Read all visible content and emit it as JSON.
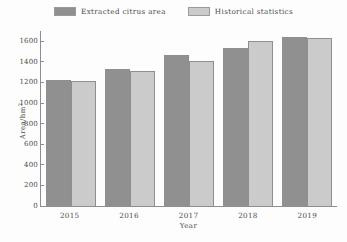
{
  "chart_data": {
    "type": "bar",
    "title": "",
    "subtitle": "",
    "xlabel": "Year",
    "ylabel": "Area/hm2",
    "ylabel_base": "Area/hm",
    "ylabel_sup": "2",
    "categories": [
      "2015",
      "2016",
      "2017",
      "2018",
      "2019"
    ],
    "series": [
      {
        "name": "Extracted citrus area",
        "color": "#909090",
        "values": [
          1225,
          1330,
          1465,
          1535,
          1640
        ]
      },
      {
        "name": "Historical statistics",
        "color": "#cbcbcb",
        "values": [
          1215,
          1315,
          1410,
          1600,
          1635
        ]
      }
    ],
    "ylim": [
      0,
      1700
    ],
    "yticks": [
      0,
      200,
      400,
      600,
      800,
      1000,
      1200,
      1400,
      1600
    ],
    "ytick_labels": [
      "0",
      "200",
      "400",
      "600",
      "800",
      "1000",
      "1200",
      "1400",
      "1600"
    ],
    "grid": false,
    "legend_position": "top-center"
  },
  "legend": {
    "entries": [
      {
        "label": "Extracted citrus area",
        "color": "#909090"
      },
      {
        "label": "Historical statistics",
        "color": "#cbcbcb"
      }
    ]
  }
}
